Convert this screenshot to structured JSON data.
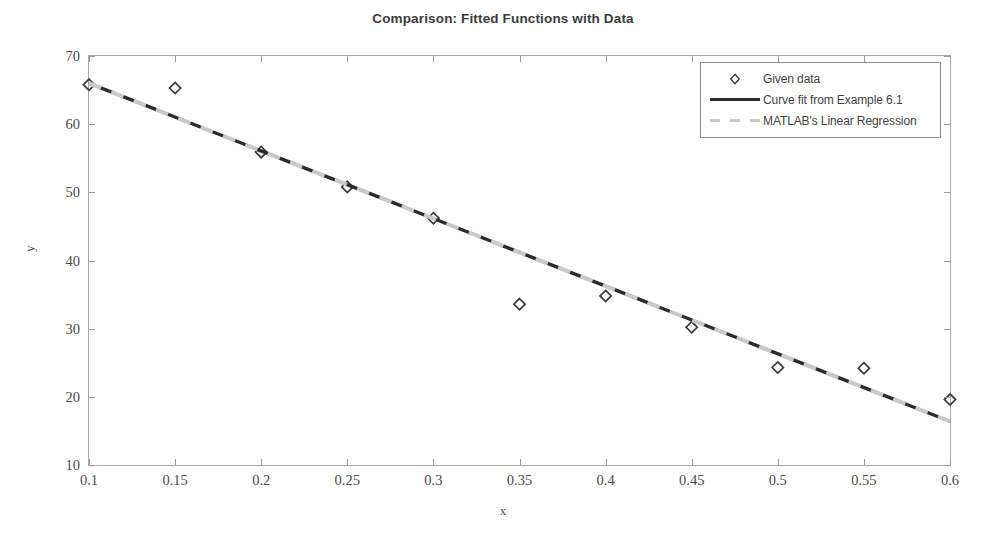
{
  "chart_data": {
    "type": "scatter",
    "title": "Comparison: Fitted Functions with Data",
    "xlabel": "x",
    "ylabel": "y",
    "xlim": [
      0.1,
      0.6
    ],
    "ylim": [
      10,
      70
    ],
    "xticks": [
      "0.1",
      "0.15",
      "0.2",
      "0.25",
      "0.3",
      "0.35",
      "0.4",
      "0.45",
      "0.5",
      "0.55",
      "0.6"
    ],
    "xtick_values": [
      0.1,
      0.15,
      0.2,
      0.25,
      0.3,
      0.35,
      0.4,
      0.45,
      0.5,
      0.55,
      0.6
    ],
    "yticks": [
      "10",
      "20",
      "30",
      "40",
      "50",
      "60",
      "70"
    ],
    "ytick_values": [
      10,
      20,
      30,
      40,
      50,
      60,
      70
    ],
    "grid": false,
    "legend_position": "top-right",
    "series": [
      {
        "name": "Given data",
        "style": "marker",
        "marker": "diamond-open",
        "color": "#3a3a3a",
        "x": [
          0.1,
          0.15,
          0.2,
          0.25,
          0.3,
          0.35,
          0.4,
          0.45,
          0.5,
          0.55,
          0.6
        ],
        "y": [
          65.8,
          65.3,
          55.9,
          50.8,
          46.2,
          33.6,
          34.8,
          30.2,
          24.3,
          24.2,
          19.6
        ]
      },
      {
        "name": "Curve fit from Example 6.1",
        "style": "line-solid",
        "color": "#2b2b2b",
        "x": [
          0.1,
          0.6
        ],
        "y": [
          66.0,
          16.4
        ]
      },
      {
        "name": "MATLAB's Linear Regression",
        "style": "line-dashed",
        "color": "#c9c9c9",
        "x": [
          0.1,
          0.6
        ],
        "y": [
          66.0,
          16.4
        ]
      }
    ],
    "annotations": []
  },
  "legend": {
    "items": [
      {
        "label": "Given data",
        "key": "marker-diamond-icon"
      },
      {
        "label": "Curve fit from Example 6.1",
        "key": "line-solid-icon"
      },
      {
        "label": "MATLAB's Linear Regression",
        "key": "line-dashed-icon"
      }
    ]
  }
}
